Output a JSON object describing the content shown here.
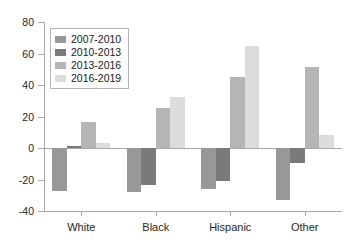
{
  "chart_data": {
    "type": "bar",
    "title": "",
    "xlabel": "",
    "ylabel": "",
    "categories": [
      "White",
      "Black",
      "Hispanic",
      "Other"
    ],
    "series": [
      {
        "name": "2007-2010",
        "color": "#989898",
        "values": [
          -27.5,
          -28,
          -26,
          -33
        ]
      },
      {
        "name": "2010-2013",
        "color": "#7a7a7a",
        "values": [
          1,
          -23.5,
          -21,
          -9.5
        ]
      },
      {
        "name": "2013-2016",
        "color": "#b5b5b5",
        "values": [
          16.5,
          25.5,
          45,
          51.5
        ]
      },
      {
        "name": "2016-2019",
        "color": "#dcdcdc",
        "values": [
          3,
          32.5,
          65,
          8.5
        ]
      }
    ],
    "ylim": [
      -40,
      80
    ],
    "yticks": [
      80,
      60,
      40,
      20,
      0,
      -20,
      -40
    ],
    "ytick_labels": [
      "80",
      "60",
      "40",
      "20",
      "0",
      "-20",
      "-40"
    ],
    "grid": false,
    "legend_position": "upper-left",
    "axis_color": "#a8a8a8",
    "background": "#ffffff"
  }
}
